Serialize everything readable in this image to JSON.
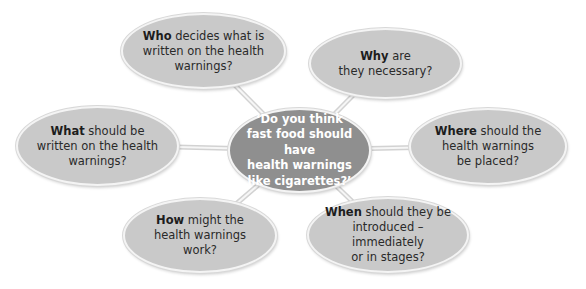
{
  "diagram": {
    "type": "mind-map",
    "colors": {
      "center_fill": "#8f8f8f",
      "outer_fill": "#c9c9c9",
      "connector": "#d6d6d6",
      "text_dark": "#2a2a2a",
      "text_light": "#ffffff"
    },
    "center": {
      "text": "‘Do you think\nfast food should have\nhealth warnings\nlike cigarettes?’"
    },
    "nodes": [
      {
        "id": "who",
        "keyword": "Who",
        "rest": " decides what is\nwritten on the health\nwarnings?"
      },
      {
        "id": "why",
        "keyword": "Why",
        "rest": " are\nthey necessary?"
      },
      {
        "id": "what",
        "keyword": "What",
        "rest": " should be\nwritten on the health\nwarnings?"
      },
      {
        "id": "where",
        "keyword": "Where",
        "rest": " should the\nhealth warnings\nbe placed?"
      },
      {
        "id": "how",
        "keyword": "How",
        "rest": " might the\nhealth warnings\nwork?"
      },
      {
        "id": "when",
        "keyword": "When",
        "rest": " should they be\nintroduced – immediately\nor in stages?"
      }
    ]
  }
}
